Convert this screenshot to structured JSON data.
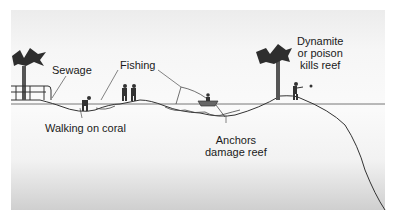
{
  "diagram": {
    "type": "coral reef threats cross-section",
    "labels": {
      "sewage": "Sewage",
      "fishing": "Fishing",
      "walking": "Walking on coral",
      "anchors_line1": "Anchors",
      "anchors_line2": "damage reef",
      "dynamite_line1": "Dynamite",
      "dynamite_line2": "or poison",
      "dynamite_line3": "kills reef"
    },
    "elements": [
      "palm-tree-left",
      "sewage-pipe",
      "person-walking",
      "people-fishing",
      "boat",
      "anchor",
      "palm-tree-right",
      "person-throwing"
    ],
    "colors": {
      "line": "#333333",
      "water_line": "#555555",
      "background_top": "#ececec",
      "background_bottom": "#cfcfcf"
    }
  }
}
